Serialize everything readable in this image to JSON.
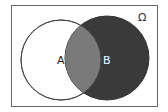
{
  "diagram": {
    "type": "venn",
    "universe_label": "Ω",
    "sets": [
      {
        "label": "A",
        "fill": "#ffffff",
        "label_color": "#222222"
      },
      {
        "label": "B",
        "fill": "#3a3a3a",
        "label_color": "#ffffff"
      }
    ],
    "intersection_fill": "#7a7a7a",
    "highlighted_region": "B",
    "frame_color": "#666666"
  }
}
